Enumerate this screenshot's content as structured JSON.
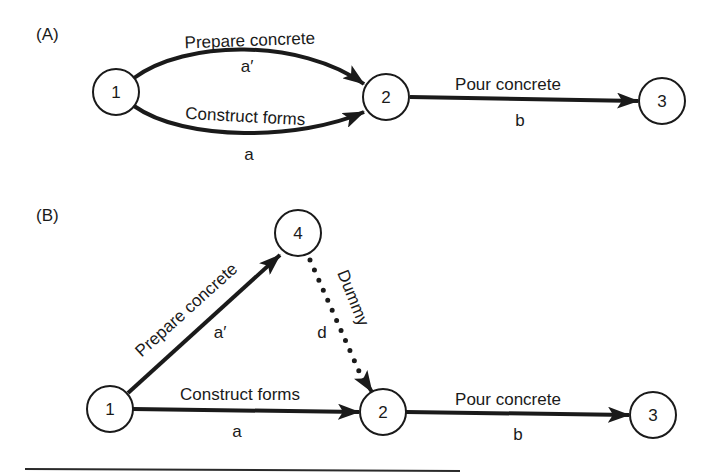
{
  "diagram": {
    "type": "activity-on-arrow network",
    "colors": {
      "ink": "#1a1a1a",
      "background": "#ffffff"
    },
    "panels": [
      {
        "id": "A",
        "label": "(A)",
        "nodes": [
          {
            "id": "1",
            "label": "1"
          },
          {
            "id": "2",
            "label": "2"
          },
          {
            "id": "3",
            "label": "3"
          }
        ],
        "edges": [
          {
            "from": "1",
            "to": "2",
            "activity": "Prepare concrete",
            "symbol": "a′",
            "style": "solid-curved-upper"
          },
          {
            "from": "1",
            "to": "2",
            "activity": "Construct forms",
            "symbol": "a",
            "style": "solid-curved-lower"
          },
          {
            "from": "2",
            "to": "3",
            "activity": "Pour concrete",
            "symbol": "b",
            "style": "solid"
          }
        ]
      },
      {
        "id": "B",
        "label": "(B)",
        "nodes": [
          {
            "id": "1",
            "label": "1"
          },
          {
            "id": "4",
            "label": "4"
          },
          {
            "id": "2",
            "label": "2"
          },
          {
            "id": "3",
            "label": "3"
          }
        ],
        "edges": [
          {
            "from": "1",
            "to": "4",
            "activity": "Prepare concrete",
            "symbol": "a′",
            "style": "solid"
          },
          {
            "from": "4",
            "to": "2",
            "activity": "Dummy",
            "symbol": "d",
            "style": "dotted"
          },
          {
            "from": "1",
            "to": "2",
            "activity": "Construct forms",
            "symbol": "a",
            "style": "solid"
          },
          {
            "from": "2",
            "to": "3",
            "activity": "Pour concrete",
            "symbol": "b",
            "style": "solid"
          }
        ]
      }
    ]
  }
}
